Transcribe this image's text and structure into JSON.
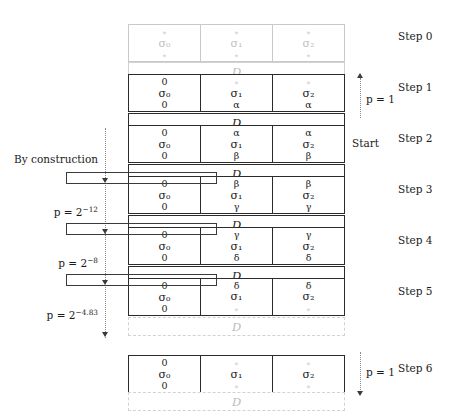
{
  "diagram": {
    "column_count": 3,
    "state_labels": [
      "σ0",
      "σ1",
      "σ2"
    ],
    "permutation_label": "D",
    "faded_placeholder": "∗",
    "blocks": [
      {
        "id": "step0",
        "step_label": "Step 0",
        "state": {
          "faded": true,
          "top": [
            "∗",
            "∗",
            "∗"
          ],
          "mid": [
            "σ₀",
            "σ₁",
            "σ₂"
          ],
          "bottom": [
            "∗",
            "∗",
            "∗"
          ],
          "highlight": false
        },
        "d_label": "D",
        "d_faded": true
      },
      {
        "id": "step1",
        "step_label": "Step 1",
        "state": {
          "faded": false,
          "top": [
            "0",
            "∗",
            "∗"
          ],
          "top_faded": [
            false,
            true,
            true
          ],
          "mid": [
            "σ₀",
            "σ₁",
            "σ₂"
          ],
          "bottom": [
            "0",
            "α",
            "α"
          ],
          "highlight": false
        },
        "d_label": "D",
        "d_faded": false
      },
      {
        "id": "step2",
        "step_label": "Step 2",
        "state": {
          "faded": false,
          "top": [
            "0",
            "α",
            "α"
          ],
          "top_faded": [
            false,
            false,
            false
          ],
          "mid": [
            "σ₀",
            "σ₁",
            "σ₂"
          ],
          "bottom": [
            "0",
            "β",
            "β"
          ],
          "highlight": false
        },
        "d_label": "D",
        "d_faded": false
      },
      {
        "id": "step3",
        "step_label": "Step 3",
        "state": {
          "faded": false,
          "top": [
            "0",
            "β",
            "β"
          ],
          "top_faded": [
            false,
            false,
            false
          ],
          "mid": [
            "σ₀",
            "σ₁",
            "σ₂"
          ],
          "bottom": [
            "0",
            "γ",
            "γ"
          ],
          "highlight": true
        },
        "d_label": "D",
        "d_faded": false
      },
      {
        "id": "step4",
        "step_label": "Step 4",
        "state": {
          "faded": false,
          "top": [
            "0",
            "γ",
            "γ"
          ],
          "top_faded": [
            false,
            false,
            false
          ],
          "mid": [
            "σ₀",
            "σ₁",
            "σ₂"
          ],
          "bottom": [
            "0",
            "δ",
            "δ"
          ],
          "highlight": true
        },
        "d_label": "D",
        "d_faded": false
      },
      {
        "id": "step5",
        "step_label": "Step 5",
        "state": {
          "faded": false,
          "top": [
            "0",
            "δ",
            "δ"
          ],
          "top_faded": [
            false,
            false,
            false
          ],
          "mid": [
            "σ₀",
            "σ₁",
            "σ₂"
          ],
          "bottom": [
            "0",
            "∗",
            "∗"
          ],
          "bottom_faded": [
            false,
            true,
            true
          ],
          "highlight": true
        },
        "d_label": "D",
        "d_faded": true
      },
      {
        "id": "step6",
        "step_label": "Step 6",
        "state": {
          "faded": false,
          "top": [
            "0",
            "∗",
            "∗"
          ],
          "top_faded": [
            false,
            true,
            true
          ],
          "mid": [
            "σ₀",
            "σ₁",
            "σ₂"
          ],
          "bottom": [
            "0",
            "∗",
            "∗"
          ],
          "bottom_faded": [
            false,
            true,
            true
          ],
          "highlight": false
        },
        "d_label": "D",
        "d_faded": true
      }
    ],
    "left_annotations": [
      {
        "id": "by-construction",
        "text": "By construction"
      },
      {
        "id": "p-2-12",
        "prefix": "p = 2",
        "exponent": "−12",
        "text": "p = 2⁻¹²"
      },
      {
        "id": "p-2-8",
        "prefix": "p = 2",
        "exponent": "−8",
        "text": "p = 2⁻⁸"
      },
      {
        "id": "p-2-483",
        "prefix": "p = 2",
        "exponent": "−4.83",
        "text": "p = 2⁻⁴·⁸³"
      }
    ],
    "right_annotations": {
      "top_probability": "p = 1",
      "bottom_probability": "p = 1",
      "start_label": "Start"
    },
    "colors": {
      "ink": "#1a1a1a",
      "box_border": "#2b2b2b",
      "faded": "#bfbfbf",
      "faded_border": "#c9c9c9",
      "highlight_border": "#3a3a3a",
      "dotted": "#8a8a8a"
    }
  }
}
